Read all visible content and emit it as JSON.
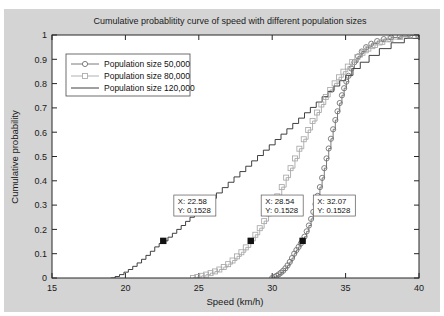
{
  "chart_data": {
    "type": "line",
    "title": "Cumulative probablitity curve of speed with different population sizes",
    "xlabel": "Speed (km/h)",
    "ylabel": "Cumulative probability",
    "xlim": [
      15,
      40
    ],
    "ylim": [
      0,
      1
    ],
    "xticks": [
      15,
      20,
      25,
      30,
      35,
      40
    ],
    "yticks": [
      0,
      0.1,
      0.2,
      0.3,
      0.4,
      0.5,
      0.6,
      0.7,
      0.8,
      0.9,
      1
    ],
    "xtick_labels": [
      "15",
      "20",
      "25",
      "30",
      "35",
      "40"
    ],
    "ytick_labels": [
      "0",
      "0.1",
      "0.2",
      "0.3",
      "0.4",
      "0.5",
      "0.6",
      "0.7",
      "0.8",
      "0.9",
      "1"
    ],
    "grid": false,
    "legend_position": "upper left",
    "series": [
      {
        "name": "Population size 50,000",
        "color": "#6b6b6b",
        "marker": "circle",
        "x": [
          30.0,
          30.15,
          30.3,
          30.45,
          30.6,
          30.75,
          30.9,
          31.05,
          31.2,
          31.35,
          31.5,
          31.65,
          31.8,
          31.95,
          32.07,
          32.2,
          32.35,
          32.5,
          32.65,
          32.8,
          32.95,
          33.1,
          33.25,
          33.4,
          33.55,
          33.7,
          33.85,
          34.0,
          34.15,
          34.3,
          34.45,
          34.6,
          34.75,
          34.9,
          35.05,
          35.2,
          35.4,
          35.6,
          35.85,
          36.1,
          36.4,
          36.75,
          37.15,
          37.6,
          38.1,
          38.7,
          39.4,
          39.95
        ],
        "y": [
          0.0,
          0.004,
          0.009,
          0.015,
          0.022,
          0.03,
          0.04,
          0.052,
          0.066,
          0.082,
          0.1,
          0.115,
          0.128,
          0.142,
          0.1528,
          0.17,
          0.192,
          0.216,
          0.243,
          0.272,
          0.304,
          0.338,
          0.374,
          0.412,
          0.452,
          0.492,
          0.533,
          0.573,
          0.612,
          0.65,
          0.686,
          0.72,
          0.752,
          0.781,
          0.808,
          0.832,
          0.862,
          0.888,
          0.912,
          0.932,
          0.95,
          0.964,
          0.975,
          0.983,
          0.99,
          0.995,
          0.998,
          1.0
        ]
      },
      {
        "name": "Population size 80,000",
        "color": "#a8a8a8",
        "marker": "square",
        "x": [
          24.6,
          24.9,
          25.2,
          25.5,
          25.8,
          26.1,
          26.4,
          26.7,
          27.0,
          27.3,
          27.6,
          27.9,
          28.2,
          28.54,
          28.85,
          29.15,
          29.45,
          29.75,
          30.05,
          30.35,
          30.65,
          30.95,
          31.25,
          31.55,
          31.85,
          32.15,
          32.45,
          32.75,
          33.05,
          33.35,
          33.65,
          33.95,
          34.25,
          34.55,
          34.85,
          35.15,
          35.45,
          35.8,
          36.15,
          36.55,
          37.0,
          37.5,
          38.05,
          38.7,
          39.4,
          39.95
        ],
        "y": [
          0.0,
          0.004,
          0.009,
          0.014,
          0.02,
          0.027,
          0.035,
          0.045,
          0.057,
          0.072,
          0.089,
          0.106,
          0.126,
          0.1528,
          0.178,
          0.205,
          0.234,
          0.266,
          0.3,
          0.336,
          0.374,
          0.413,
          0.452,
          0.492,
          0.532,
          0.571,
          0.609,
          0.646,
          0.681,
          0.714,
          0.745,
          0.774,
          0.801,
          0.826,
          0.849,
          0.87,
          0.889,
          0.909,
          0.927,
          0.944,
          0.959,
          0.972,
          0.983,
          0.992,
          0.998,
          1.0
        ]
      },
      {
        "name": "Population size 120,000",
        "color": "#2b2b2b",
        "marker": "none",
        "x": [
          19.0,
          19.3,
          19.6,
          19.9,
          20.2,
          20.5,
          20.8,
          21.1,
          21.4,
          21.7,
          22.0,
          22.3,
          22.58,
          22.9,
          23.2,
          23.5,
          23.8,
          24.1,
          24.4,
          24.7,
          25.0,
          25.4,
          25.8,
          26.2,
          26.6,
          27.0,
          27.4,
          27.8,
          28.2,
          28.6,
          29.0,
          29.4,
          29.8,
          30.2,
          30.6,
          31.0,
          31.4,
          31.8,
          32.2,
          32.6,
          33.0,
          33.4,
          33.8,
          34.2,
          34.6,
          35.0,
          35.5,
          36.0,
          36.6,
          37.3,
          38.1,
          39.0,
          39.95
        ],
        "y": [
          0.0,
          0.006,
          0.014,
          0.024,
          0.035,
          0.048,
          0.062,
          0.077,
          0.093,
          0.11,
          0.128,
          0.142,
          0.1528,
          0.168,
          0.184,
          0.2,
          0.216,
          0.233,
          0.25,
          0.267,
          0.284,
          0.306,
          0.328,
          0.35,
          0.372,
          0.394,
          0.416,
          0.438,
          0.46,
          0.482,
          0.504,
          0.526,
          0.548,
          0.57,
          0.592,
          0.614,
          0.636,
          0.658,
          0.68,
          0.702,
          0.724,
          0.746,
          0.768,
          0.79,
          0.812,
          0.834,
          0.862,
          0.888,
          0.916,
          0.944,
          0.968,
          0.986,
          1.0
        ]
      }
    ],
    "datatips": [
      {
        "label_x": "X: 22.58",
        "label_y": "Y: 0.1528",
        "x": 22.58,
        "y": 0.1528,
        "box_x": 23.3,
        "box_y": 0.255
      },
      {
        "label_x": "X: 28.54",
        "label_y": "Y: 0.1528",
        "x": 28.54,
        "y": 0.1528,
        "box_x": 29.25,
        "box_y": 0.255
      },
      {
        "label_x": "X: 32.07",
        "label_y": "Y: 0.1528",
        "x": 32.07,
        "y": 0.1528,
        "box_x": 32.8,
        "box_y": 0.255
      }
    ]
  },
  "figure": {
    "background": "#d4d4d4",
    "axes_background": "#ffffff",
    "axes_color": "#262626"
  }
}
